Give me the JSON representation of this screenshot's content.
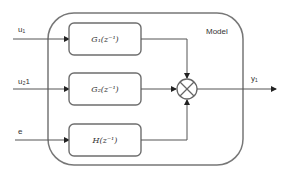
{
  "diagram": {
    "type": "block-diagram",
    "container": {
      "label": "Model"
    },
    "inputs": [
      {
        "id": "u1",
        "label": "u₁"
      },
      {
        "id": "u2",
        "label": "u₂1"
      },
      {
        "id": "e",
        "label": "e"
      }
    ],
    "blocks": [
      {
        "id": "G1",
        "label": "G₁(z⁻¹)"
      },
      {
        "id": "G2",
        "label": "G₂(z⁻¹)"
      },
      {
        "id": "H",
        "label": "H(z⁻¹)"
      }
    ],
    "junction": {
      "type": "summing",
      "symbol": "⊗"
    },
    "output": {
      "id": "y1",
      "label": "y₁"
    },
    "edges": [
      [
        "u1",
        "G1"
      ],
      [
        "u2",
        "G2"
      ],
      [
        "e",
        "H"
      ],
      [
        "G1",
        "junction"
      ],
      [
        "G2",
        "junction"
      ],
      [
        "H",
        "junction"
      ],
      [
        "junction",
        "y1"
      ]
    ]
  },
  "colors": {
    "stroke": "#6e6e6e",
    "wire": "#555555",
    "background": "#ffffff"
  }
}
